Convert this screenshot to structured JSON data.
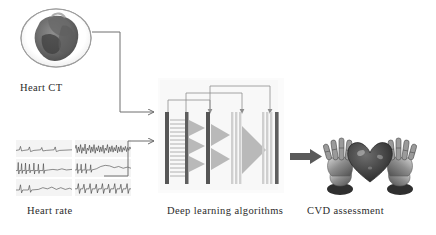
{
  "figure": {
    "type": "pipeline-diagram",
    "background_color": "#ffffff",
    "title_text": "",
    "flow": "Heart CT and Heart rate inputs feed Deep learning algorithms which output CVD assessment"
  },
  "labels": {
    "heart_ct": "Heart CT",
    "heart_rate": "Heart rate",
    "deep_learning": "Deep learning algorithms",
    "cvd_assessment": "CVD assessment"
  },
  "nodes": [
    {
      "id": "heart-ct",
      "label": "Heart CT",
      "kind": "image",
      "description": "grayscale cardiac CT cross-section inside an oval outline"
    },
    {
      "id": "heart-rate",
      "label": "Heart rate",
      "kind": "image-grid",
      "description": "six ECG waveform panels arranged in 2 columns by 3 rows",
      "panels": 6,
      "columns": 2,
      "rows": 3
    },
    {
      "id": "deep-learning",
      "label": "Deep learning algorithms",
      "kind": "neural-network-schematic",
      "description": "stacked convolutional layer bars with pooling triangles and skip connections",
      "layers": 6,
      "skip_connections": 3
    },
    {
      "id": "cvd-assessment",
      "label": "CVD assessment",
      "kind": "image",
      "description": "two robotic hands cradling a dark heart"
    }
  ],
  "edges": [
    {
      "from": "heart-ct",
      "to": "deep-learning",
      "style": "elbow-arrow"
    },
    {
      "from": "heart-rate",
      "to": "deep-learning",
      "style": "elbow-arrow"
    },
    {
      "from": "deep-learning",
      "to": "cvd-assessment",
      "style": "block-arrow"
    }
  ],
  "colors": {
    "text": "#2b2b2b",
    "connector": "#6e6e6e",
    "block_arrow": "#5a5a5a",
    "layer_dark": "#555555",
    "layer_light": "#cfcfcf",
    "triangle": "#b9b9b9",
    "ecg_panel_bg": "#f4f4f4",
    "ecg_trace": "#3a3a3a"
  }
}
